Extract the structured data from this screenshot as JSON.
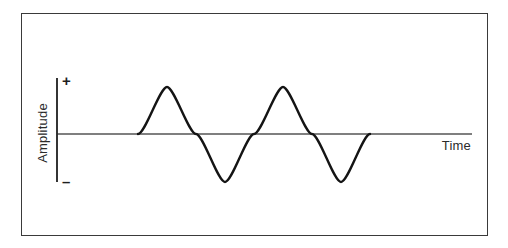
{
  "figure": {
    "kind": "waveform-diagram",
    "background_color": "#ffffff",
    "frame": {
      "border_color": "#3a3a3a",
      "border_width_px": 1.5,
      "x": 21,
      "y": 13,
      "width": 467,
      "height": 223
    }
  },
  "axes": {
    "y_axis": {
      "label": "Amplitude",
      "label_rotation_deg": -90,
      "positive_marker": "+",
      "negative_marker": "–",
      "line_color": "#2b2b2b",
      "x_px": 57,
      "top_px": 78,
      "bottom_px": 182
    },
    "x_axis": {
      "label": "Time",
      "line_color": "#555555",
      "y_px": 134,
      "left_px": 57,
      "right_px": 472
    }
  },
  "chart_data": {
    "type": "line",
    "title": "",
    "subtitle": "",
    "xlabel": "Time",
    "ylabel": "Amplitude",
    "xlim": [
      0,
      1
    ],
    "ylim": [
      -1,
      1
    ],
    "grid": false,
    "legend": "none",
    "annotations": [
      "+",
      "–",
      "Time",
      "Amplitude"
    ],
    "tick_labels": {
      "y": [
        "+",
        "–"
      ],
      "x": []
    },
    "waveform": {
      "shape": "sine",
      "cycles": 2,
      "amplitude": 1,
      "phase": 0,
      "start_x_px": 138,
      "end_x_px": 370,
      "baseline_y_px": 134,
      "peak_y_px": 87,
      "trough_y_px": 182,
      "stroke_color": "#141414",
      "stroke_width_px": 2.4
    },
    "key_points_px": [
      {
        "name": "zero-crossing-start",
        "x": 138,
        "y": 134
      },
      {
        "name": "peak-1",
        "x": 167,
        "y": 87
      },
      {
        "name": "zero-crossing-1",
        "x": 196,
        "y": 134
      },
      {
        "name": "trough-1",
        "x": 225,
        "y": 182
      },
      {
        "name": "zero-crossing-2",
        "x": 254,
        "y": 134
      },
      {
        "name": "peak-2",
        "x": 283,
        "y": 87
      },
      {
        "name": "zero-crossing-3",
        "x": 312,
        "y": 134
      },
      {
        "name": "trough-2",
        "x": 341,
        "y": 182
      },
      {
        "name": "zero-crossing-end",
        "x": 370,
        "y": 134
      }
    ],
    "series": [
      {
        "name": "sine wave",
        "x": [
          0.0,
          0.031,
          0.063,
          0.094,
          0.125,
          0.156,
          0.188,
          0.219,
          0.25,
          0.281,
          0.313,
          0.344,
          0.375,
          0.406,
          0.438,
          0.469,
          0.5,
          0.531,
          0.563,
          0.594,
          0.625,
          0.656,
          0.688,
          0.719,
          0.75,
          0.781,
          0.813,
          0.844,
          0.875,
          0.906,
          0.938,
          0.969,
          1.0
        ],
        "values": [
          0.0,
          0.383,
          0.707,
          0.924,
          1.0,
          0.924,
          0.707,
          0.383,
          0.0,
          -0.383,
          -0.707,
          -0.924,
          -1.0,
          -0.924,
          -0.707,
          -0.383,
          0.0,
          0.383,
          0.707,
          0.924,
          1.0,
          0.924,
          0.707,
          0.383,
          0.0,
          -0.383,
          -0.707,
          -0.924,
          -1.0,
          -0.924,
          -0.707,
          -0.383,
          0.0
        ]
      }
    ]
  }
}
